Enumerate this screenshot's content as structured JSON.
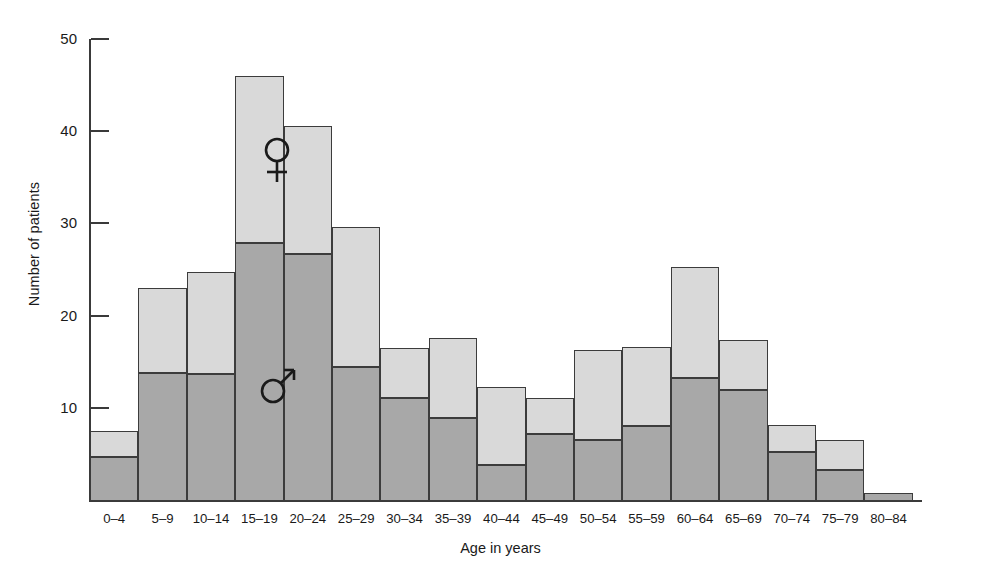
{
  "chart_data": {
    "type": "bar",
    "stacked": true,
    "title": "",
    "subtitle": "",
    "xlabel": "Age in years",
    "ylabel": "Number of patients",
    "ylim": [
      0,
      50
    ],
    "yticks": [
      10,
      20,
      30,
      40,
      50
    ],
    "grid": false,
    "legend_position": "inside-plot",
    "categories": [
      "0–4",
      "5–9",
      "10–14",
      "15–19",
      "20–24",
      "25–29",
      "30–34",
      "35–39",
      "40–44",
      "45–49",
      "50–54",
      "55–59",
      "60–64",
      "65–69",
      "70–74",
      "75–79",
      "80–84"
    ],
    "series": [
      {
        "name": "Male",
        "symbol": "♂",
        "color": "#a8a8a8",
        "values": [
          4.7,
          13.8,
          13.7,
          27.9,
          26.7,
          14.4,
          11.1,
          8.9,
          3.8,
          7.2,
          6.5,
          8.0,
          13.2,
          11.9,
          5.2,
          3.2,
          0.8
        ]
      },
      {
        "name": "Female",
        "symbol": "♀",
        "color": "#d9d9d9",
        "values": [
          2.8,
          9.2,
          11.0,
          18.1,
          13.9,
          15.2,
          5.4,
          8.7,
          8.5,
          3.9,
          9.8,
          8.6,
          12.1,
          5.4,
          2.9,
          3.3,
          0.0
        ]
      }
    ],
    "totals": [
      7.5,
      23.0,
      24.7,
      46.0,
      40.6,
      29.6,
      16.5,
      17.6,
      12.3,
      11.1,
      16.3,
      16.6,
      25.3,
      17.3,
      8.1,
      6.5,
      0.8
    ],
    "annotations": [
      {
        "name": "female-symbol",
        "glyph": "♀",
        "category": "15–19",
        "approx_y": 37.5
      },
      {
        "name": "male-symbol",
        "glyph": "♂",
        "category": "15–19",
        "approx_y": 12.5
      }
    ]
  },
  "axis": {
    "y_tick_labels": [
      "50",
      "40",
      "30",
      "20",
      "10"
    ],
    "y_label_text": "Number of patients",
    "x_label_text": "Age in years"
  },
  "legend": {
    "female_symbol": "♀",
    "male_symbol": "♂"
  }
}
